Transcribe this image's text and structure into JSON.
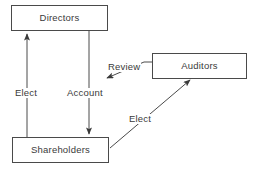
{
  "diagram": {
    "background_color": "#ffffff",
    "stroke_color": "#4a4a4a",
    "text_color": "#3a3a3a",
    "nodes": [
      {
        "id": "directors",
        "label": "Directors"
      },
      {
        "id": "shareholders",
        "label": "Shareholders"
      },
      {
        "id": "auditors",
        "label": "Auditors"
      }
    ],
    "edges": [
      {
        "id": "elect-directors",
        "label": "Elect",
        "from": "shareholders",
        "to": "directors",
        "shape": "vertical-up"
      },
      {
        "id": "account",
        "label": "Account",
        "from": "directors",
        "to": "shareholders",
        "shape": "vertical-down"
      },
      {
        "id": "review",
        "label": "Review",
        "from": "auditors",
        "to": "directors",
        "shape": "elbow-diagonal"
      },
      {
        "id": "elect-auditors",
        "label": "Elect",
        "from": "shareholders",
        "to": "auditors",
        "shape": "diagonal-up-right"
      }
    ]
  }
}
